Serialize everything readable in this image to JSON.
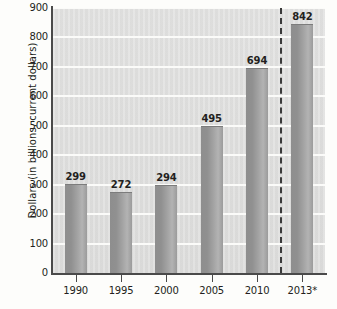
{
  "chart_data": {
    "type": "bar",
    "title": "",
    "xlabel": "",
    "ylabel": "Dollars (in billions, current dollars)",
    "categories": [
      "1990",
      "1995",
      "2000",
      "2005",
      "2010",
      "2013*"
    ],
    "values": [
      299,
      272,
      294,
      495,
      694,
      842
    ],
    "value_labels": [
      "299",
      "272",
      "294",
      "495",
      "694",
      "842"
    ],
    "ylim": [
      0,
      900
    ],
    "ytick_labels": [
      "0",
      "100",
      "200",
      "300",
      "400",
      "500",
      "600",
      "700",
      "800",
      "900"
    ],
    "ytick_values": [
      0,
      100,
      200,
      300,
      400,
      500,
      600,
      700,
      800,
      900
    ],
    "grid": "horizontal",
    "legend": "none",
    "annotations": [
      {
        "name": "projection-divider",
        "type": "vertical-dashed-line",
        "between_categories": [
          "2010",
          "2013*"
        ]
      }
    ],
    "colors": {
      "bar": "#9b9b9b",
      "bar_dark": "#8e8e8e",
      "bar_light": "#b3b3b3",
      "plot_background": "#dedede",
      "gridline": "#fbfbf9",
      "axis": "#4a4a4a",
      "text": "#231f20",
      "divider": "#3a3a3a"
    }
  }
}
